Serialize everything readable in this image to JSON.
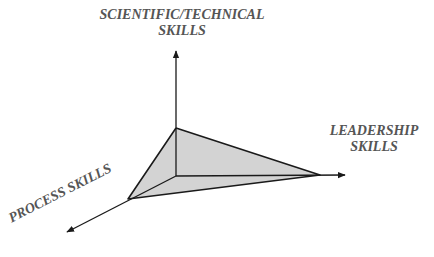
{
  "diagram": {
    "type": "3d-axes-triangle",
    "axes": [
      {
        "id": "scientific-technical",
        "label_lines": [
          "SCIENTIFIC/TECHNICAL",
          "SKILLS"
        ],
        "direction": "up"
      },
      {
        "id": "leadership",
        "label_lines": [
          "LEADERSHIP",
          "SKILLS"
        ],
        "direction": "right"
      },
      {
        "id": "process",
        "label_lines": [
          "PROCESS SKILLS"
        ],
        "direction": "down-left"
      }
    ],
    "colors": {
      "line": "#1a1a1a",
      "fill": "#d3d3d3",
      "label": "#555555",
      "background": "#ffffff"
    },
    "geometry": {
      "origin": [
        176,
        176
      ],
      "axis_tips": {
        "up": [
          176,
          50
        ],
        "right": [
          346,
          175
        ],
        "down_left": [
          66,
          232
        ]
      },
      "triangle_vertices": {
        "top": [
          176,
          128
        ],
        "right": [
          320,
          175
        ],
        "left": [
          128,
          199
        ]
      }
    }
  }
}
